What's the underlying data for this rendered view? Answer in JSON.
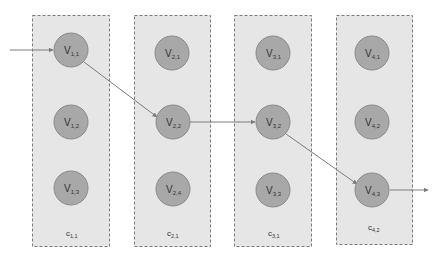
{
  "diagram": {
    "columns": [
      {
        "id": "col1",
        "label": {
          "base": "c",
          "sub": "1,1"
        },
        "nodes": [
          {
            "id": "v11",
            "base": "V",
            "sub": "1,1"
          },
          {
            "id": "v12",
            "base": "V",
            "sub": "1,2"
          },
          {
            "id": "v13",
            "base": "V",
            "sub": "1,3"
          }
        ]
      },
      {
        "id": "col2",
        "label": {
          "base": "c",
          "sub": "2,1"
        },
        "nodes": [
          {
            "id": "v21",
            "base": "V",
            "sub": "2,1"
          },
          {
            "id": "v22",
            "base": "V",
            "sub": "2,2"
          },
          {
            "id": "v24",
            "base": "V",
            "sub": "2,4"
          }
        ]
      },
      {
        "id": "col3",
        "label": {
          "base": "c",
          "sub": "3,1"
        },
        "nodes": [
          {
            "id": "v31",
            "base": "V",
            "sub": "3,1"
          },
          {
            "id": "v32",
            "base": "V",
            "sub": "3,2"
          },
          {
            "id": "v33",
            "base": "V",
            "sub": "3,3"
          }
        ]
      },
      {
        "id": "col4",
        "label": {
          "base": "c",
          "sub": "4,2"
        },
        "nodes": [
          {
            "id": "v41",
            "base": "V",
            "sub": "4,1"
          },
          {
            "id": "v42",
            "base": "V",
            "sub": "4,2"
          },
          {
            "id": "v43",
            "base": "V",
            "sub": "4,3"
          }
        ]
      }
    ],
    "path": [
      "entry",
      "v11",
      "v22",
      "v32",
      "v43",
      "exit"
    ],
    "colors": {
      "column_fill": "#e6e6e6",
      "column_border": "#7a7a7a",
      "node_fill": "#a8a8a8",
      "node_border": "#8a8a8a",
      "edge": "#7c7c7c"
    }
  }
}
